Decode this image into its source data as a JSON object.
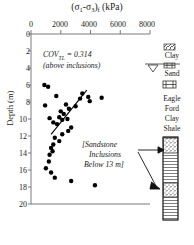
{
  "chart_data": {
    "type": "scatter",
    "title_main": "(σ",
    "xlabel": "(σ₁-σ₃)f (kPa)",
    "ylabel": "Depth (m)",
    "xlim": [
      0,
      8000
    ],
    "ylim": [
      0,
      20
    ],
    "y_inverted": true,
    "grid": false,
    "xticks": [
      0,
      2000,
      4000,
      6000,
      8000
    ],
    "xticklabels": [
      "0",
      "2000",
      "4000",
      "6000",
      "8000"
    ],
    "yticks": [
      0,
      2,
      4,
      6,
      8,
      10,
      12,
      14,
      16,
      18,
      20
    ],
    "yticklabels": [
      "0",
      "2",
      "4",
      "6",
      "8",
      "10",
      "12",
      "14",
      "16",
      "18",
      "20"
    ],
    "legend": [],
    "marker": "filled-circle",
    "marker_color": "#000000",
    "points": [
      {
        "x": 900,
        "y": 6.0
      },
      {
        "x": 1150,
        "y": 6.2
      },
      {
        "x": 1700,
        "y": 7.3
      },
      {
        "x": 950,
        "y": 8.4
      },
      {
        "x": 2350,
        "y": 8.3
      },
      {
        "x": 2550,
        "y": 8.8
      },
      {
        "x": 2000,
        "y": 9.1
      },
      {
        "x": 2200,
        "y": 9.4
      },
      {
        "x": 1250,
        "y": 9.9
      },
      {
        "x": 1900,
        "y": 9.8
      },
      {
        "x": 2100,
        "y": 10.1
      },
      {
        "x": 1500,
        "y": 10.4
      },
      {
        "x": 1750,
        "y": 10.6
      },
      {
        "x": 2450,
        "y": 10.0
      },
      {
        "x": 3000,
        "y": 8.5
      },
      {
        "x": 3300,
        "y": 7.6
      },
      {
        "x": 3450,
        "y": 7.0
      },
      {
        "x": 3850,
        "y": 7.4
      },
      {
        "x": 3950,
        "y": 7.9
      },
      {
        "x": 4750,
        "y": 7.5
      },
      {
        "x": 2700,
        "y": 11.0
      },
      {
        "x": 2500,
        "y": 11.4
      },
      {
        "x": 2100,
        "y": 11.8
      },
      {
        "x": 1600,
        "y": 12.2
      },
      {
        "x": 1900,
        "y": 12.6
      },
      {
        "x": 1500,
        "y": 13.0
      },
      {
        "x": 1350,
        "y": 13.4
      },
      {
        "x": 1450,
        "y": 13.8
      },
      {
        "x": 1250,
        "y": 14.2
      },
      {
        "x": 1200,
        "y": 15.0
      },
      {
        "x": 1000,
        "y": 15.8
      },
      {
        "x": 1350,
        "y": 16.3
      },
      {
        "x": 1600,
        "y": 16.9
      },
      {
        "x": 2700,
        "y": 17.3
      },
      {
        "x": 4300,
        "y": 17.8
      }
    ],
    "trendline": {
      "x1": 1350,
      "y1": 11.8,
      "x2": 3750,
      "y2": 6.6
    }
  },
  "annotations": {
    "cov_line1": "COV",
    "cov_sub": "TL",
    "cov_line1b": " = 0.314",
    "cov_line2": "(above inclusions)",
    "inclusion_line1": "[Sandstone",
    "inclusion_line2": "Inclusions",
    "inclusion_line3": "Below 13 m]"
  },
  "stratigraphy": {
    "layers": [
      "Clay",
      "Sand",
      "Eagle",
      "Ford",
      "Clay",
      "Shale"
    ],
    "water_table_symbol": "water-table-triangle",
    "column_pattern": [
      "sandstone-inclusion-band",
      "shale-horizontal-lines",
      "sandstone-inclusion-band"
    ]
  },
  "colors": {
    "axis": "#6b6b6b",
    "marker": "#000000",
    "text": "#1a1a1a",
    "trendline": "#000000"
  }
}
